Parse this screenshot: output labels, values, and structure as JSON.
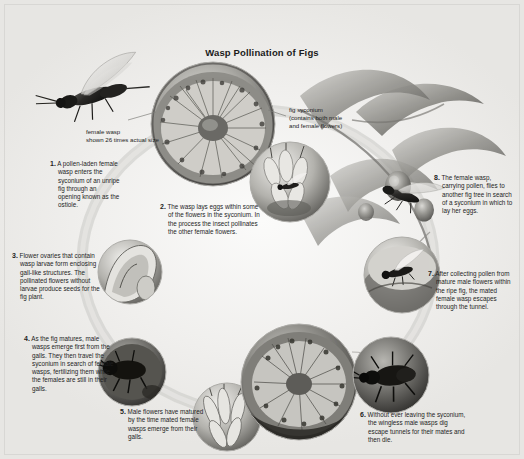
{
  "figure": {
    "title": "Wasp Pollination of Figs",
    "type": "life-cycle-diagram",
    "palette": {
      "background": "#f2f2f0",
      "text": "#1d1d1d",
      "ring": "#b9b8b4",
      "photo_mid": "#9a9a96",
      "photo_dark": "#3a3a38",
      "photo_light": "#e3e2df"
    }
  },
  "labels": [
    {
      "id": "female-wasp-scale",
      "text": "female wasp\nshown 26 times actual size",
      "line1": "female wasp",
      "line2": "shown 26 times actual size"
    },
    {
      "id": "fig-syconium",
      "line1": "fig syconium",
      "line2": "(contains both male",
      "line3": "and female flowers)"
    }
  ],
  "steps": [
    {
      "number": "1.",
      "text": "A pollen-laden female wasp enters the syconium of an unripe fig through an opening known as the ostiole."
    },
    {
      "number": "2.",
      "text": "The wasp lays eggs within some of the flowers in the syconium. In the process the insect pollinates the other female flowers."
    },
    {
      "number": "3.",
      "text": "Flower ovaries that contain wasp larvae form enclosing gall-like structures. The pollinated flowers without larvae produce seeds for the fig plant."
    },
    {
      "number": "4.",
      "text": "As the fig matures, male wasps emerge first from the galls. They then travel the syconium in search of female wasps, fertilizing them while the females are still in their galls."
    },
    {
      "number": "5.",
      "text": "Male flowers have matured by the time mated female wasps emerge from their galls."
    },
    {
      "number": "6.",
      "text": "Without ever leaving the syconium, the wingless male wasps dig escape tunnels for their mates and then die."
    },
    {
      "number": "7.",
      "text": "After collecting pollen from mature male flowers within the ripe fig, the mated female wasp escapes through the tunnel."
    },
    {
      "number": "8.",
      "text": "The female wasp, carrying pollen, flies to another fig tree in search of a syconium in which to lay her eggs."
    }
  ],
  "photos": [
    {
      "id": "wasp-flying",
      "caption_ref": "female-wasp-scale",
      "depicts": "winged female fig wasp in flight"
    },
    {
      "id": "fig-cutaway-top",
      "caption_ref": "fig-syconium",
      "depicts": "cut-open unripe fig showing internal flowers"
    },
    {
      "id": "flower-cluster",
      "depicts": "wasp laying eggs among syconium flowers"
    },
    {
      "id": "gall-structures",
      "depicts": "gall-like ovary structures with larvae"
    },
    {
      "id": "male-wasp-emerging",
      "depicts": "male wasps emerging from galls"
    },
    {
      "id": "ripe-fig-cutaway",
      "depicts": "ripe fig cutaway with mature male flowers"
    },
    {
      "id": "wingless-male-wasp",
      "depicts": "wingless male wasp digging escape tunnel"
    },
    {
      "id": "female-exiting",
      "depicts": "mated female wasp escaping through tunnel"
    },
    {
      "id": "fig-tree-branch",
      "depicts": "fig tree branch with leaves and ripe figs"
    }
  ]
}
